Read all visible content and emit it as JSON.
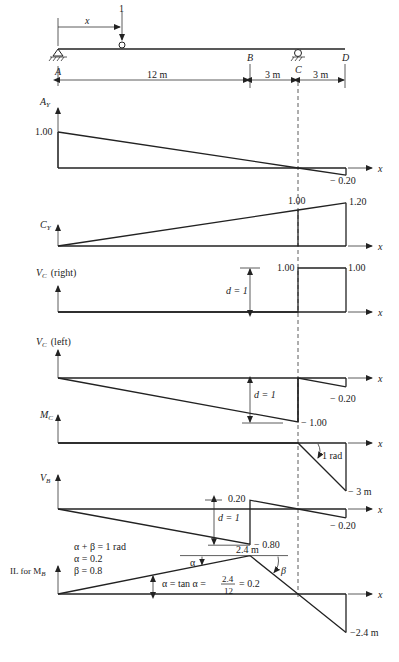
{
  "beam": {
    "load_label": "1",
    "position_label": "x",
    "points": [
      "A",
      "B",
      "C",
      "D"
    ],
    "spans": [
      {
        "from": "A",
        "to": "B",
        "length_m": 12,
        "label": "12 m"
      },
      {
        "from": "B",
        "to": "C",
        "length_m": 3,
        "label": "3 m"
      },
      {
        "from": "C",
        "to": "D",
        "length_m": 3,
        "label": "3 m"
      }
    ],
    "supports": [
      {
        "at": "A",
        "type": "pin"
      },
      {
        "at": "C",
        "type": "roller"
      }
    ]
  },
  "x_axis_label": "x",
  "chart_data": [
    {
      "type": "line",
      "id": "ay",
      "title": "A",
      "subscript": "Y",
      "x": [
        0,
        15,
        18
      ],
      "y": [
        1.0,
        0.0,
        -0.2
      ],
      "labels": [
        {
          "text": "1.00",
          "at_x": 0
        },
        {
          "text": "− 0.20",
          "at_x": 18
        }
      ]
    },
    {
      "type": "line",
      "id": "cy",
      "title": "C",
      "subscript": "Y",
      "x": [
        0,
        15,
        18
      ],
      "y": [
        0.0,
        1.0,
        1.2
      ],
      "labels": [
        {
          "text": "1.00",
          "at_x": 15
        },
        {
          "text": "1.20",
          "at_x": 18
        }
      ]
    },
    {
      "type": "line",
      "id": "vc_right",
      "title": "V",
      "subscript": "C",
      "suffix": "(right)",
      "x": [
        0,
        15,
        15,
        18
      ],
      "y": [
        0,
        0,
        1.0,
        1.0
      ],
      "labels": [
        {
          "text": "1.00",
          "at_x": 15
        },
        {
          "text": "1.00",
          "at_x": 18
        }
      ],
      "annotation": "d = 1"
    },
    {
      "type": "line",
      "id": "vc_left",
      "title": "V",
      "subscript": "C",
      "suffix": "(left)",
      "x": [
        0,
        15,
        15,
        18
      ],
      "y": [
        0,
        -1.0,
        0,
        -0.2
      ],
      "labels": [
        {
          "text": "− 1.00",
          "at_x": 15
        },
        {
          "text": "− 0.20",
          "at_x": 18
        }
      ],
      "annotation": "d = 1"
    },
    {
      "type": "line",
      "id": "mc",
      "title": "M",
      "subscript": "C",
      "x": [
        0,
        15,
        18
      ],
      "y": [
        0,
        0,
        -3
      ],
      "labels": [
        {
          "text": "− 3 m",
          "at_x": 18
        }
      ],
      "annotation": "1 rad"
    },
    {
      "type": "line",
      "id": "vb",
      "title": "V",
      "subscript": "B",
      "x": [
        0,
        12,
        12,
        15,
        18
      ],
      "y": [
        0,
        -0.8,
        0.2,
        0,
        -0.2
      ],
      "labels": [
        {
          "text": "0.20",
          "at_x": 12
        },
        {
          "text": "− 0.80",
          "at_x": 12
        },
        {
          "text": "− 0.20",
          "at_x": 18
        }
      ],
      "annotation": "d = 1"
    },
    {
      "type": "line",
      "id": "il_mb",
      "title": "IL for M",
      "subscript": "B",
      "x": [
        0,
        12,
        15,
        18
      ],
      "y": [
        0,
        2.4,
        0,
        -2.4
      ],
      "labels": [
        {
          "text": "2.4 m",
          "at_x": 12
        },
        {
          "text": "−2.4 m",
          "at_x": 18
        }
      ],
      "notes": [
        "α + β = 1 rad",
        "α = 0.2",
        "β = 0.8"
      ],
      "alpha_label": "α",
      "beta_label": "β",
      "formula": {
        "lhs": "α = tan α =",
        "num": "2.4",
        "den": "12",
        "rhs": "= 0.2"
      }
    }
  ]
}
